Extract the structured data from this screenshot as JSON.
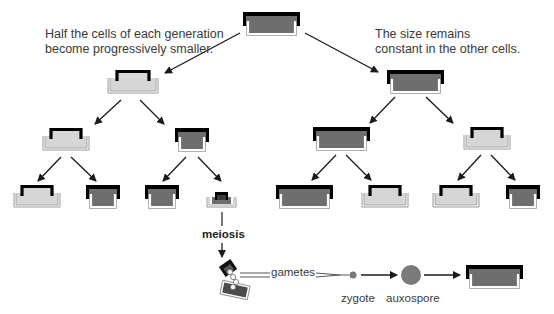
{
  "captions": {
    "left": "Half the cells of each generation\nbecome progressively smaller.",
    "right": "The size remains\nconstant in the other cells."
  },
  "labels": {
    "meiosis": "meiosis",
    "gametes": "gametes",
    "zygote": "zygote",
    "auxospore": "auxospore"
  },
  "colors": {
    "dark_fill": "#6e6e6e",
    "light_fill": "#d6d6d6",
    "lid": "#000000",
    "arrow": "#1a1a1a",
    "auxospore": "#7a7a7a",
    "zygote": "#7a7a7a"
  },
  "cells": [
    {
      "id": "root",
      "type": "dark",
      "generation": 0
    },
    {
      "id": "g1-left",
      "type": "light",
      "generation": 1
    },
    {
      "id": "g1-right",
      "type": "dark",
      "generation": 1
    },
    {
      "id": "g2-ll",
      "type": "light",
      "generation": 2
    },
    {
      "id": "g2-lr",
      "type": "dark",
      "generation": 2
    },
    {
      "id": "g2-rl",
      "type": "dark",
      "generation": 2
    },
    {
      "id": "g2-rr",
      "type": "light",
      "generation": 2
    },
    {
      "id": "g3-1",
      "type": "light",
      "generation": 3
    },
    {
      "id": "g3-2",
      "type": "dark",
      "generation": 3
    },
    {
      "id": "g3-3",
      "type": "dark",
      "generation": 3
    },
    {
      "id": "g3-4",
      "type": "small",
      "generation": 3
    },
    {
      "id": "g3-5",
      "type": "dark",
      "generation": 3
    },
    {
      "id": "g3-6",
      "type": "light",
      "generation": 3
    },
    {
      "id": "g3-7",
      "type": "light",
      "generation": 3
    },
    {
      "id": "g3-8",
      "type": "dark",
      "generation": 3
    },
    {
      "id": "restored",
      "type": "dark",
      "generation": 4
    }
  ]
}
